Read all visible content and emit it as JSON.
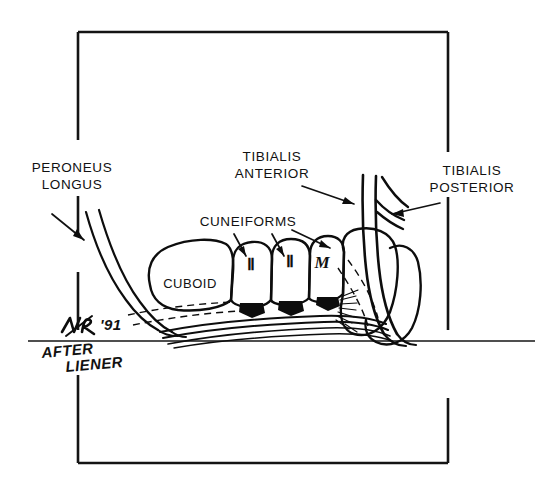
{
  "figure": {
    "attribution_line1": "AFTER",
    "attribution_line2": "LIENER",
    "signature_year": "'91",
    "signature_initials": "MR"
  },
  "labels": {
    "peroneus_longus": {
      "line1": "PERONEUS",
      "line2": "LONGUS"
    },
    "tibialis_anterior": {
      "line1": "TIBIALIS",
      "line2": "ANTERIOR"
    },
    "tibialis_posterior": {
      "line1": "TIBIALIS",
      "line2": "POSTERIOR"
    },
    "cuneiforms": {
      "line1": "CUNEIFORMS"
    }
  },
  "bones": {
    "cuboid": "CUBOID",
    "lateral_cuneiform": "Ⅱ",
    "intermediate_cuneiform": "Ⅱ",
    "medial_cuneiform": "M"
  },
  "colors": {
    "ink": "#0d0d0d",
    "frame": "#141414",
    "background": "#ffffff"
  }
}
